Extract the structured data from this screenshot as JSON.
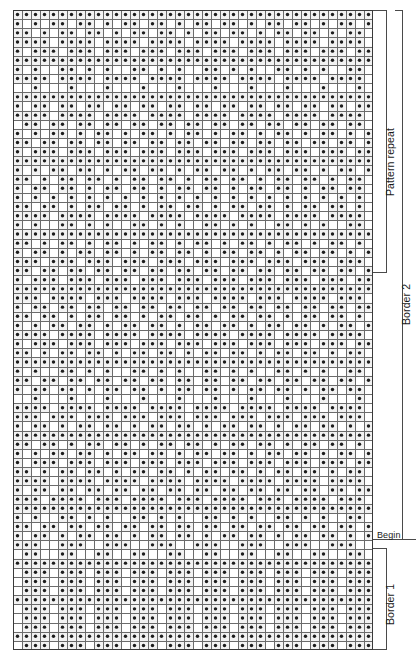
{
  "chart": {
    "grid": {
      "columns": 40,
      "rows": 70,
      "cell_size_px": 9,
      "filled_symbol": "dot",
      "empty_symbol": "blank",
      "grid_line_color": "#6b6b6b",
      "dot_color": "#1c1c1c",
      "cell_background": "#f2f2f2",
      "empty_cell_background": "#ffffff"
    },
    "rows_data": [
      "1111111111111111111111111111111111111111",
      "1010110110101101101011011010110110101101",
      "1101011011010110110101101101011011010110",
      "1111011110111101111011110111101111011110",
      "1011101110111011101110111011101110111011",
      "1111111111111111111111111111111111111111",
      "1010011010100110101001101010011010100110",
      "1111011110111101111011110111101111011110",
      "0010001000100010001000100010001000100010",
      "1111111111111111111111111111111111111111",
      "1011011011011011011011011011011011011011",
      "1111011110111101111011110111101111011110",
      "0110110110110110110110110110110110110110",
      "1010110101101011010110101101011010110101",
      "1101101101101101101101101101101101101101",
      "1011101110111011101110111011101110111011",
      "1111111111111111111111111111111111111111",
      "1010110110101101101011011010110110101101",
      "1101011011010110110101101101011011010110",
      "1011011010110110101101101011011010110110",
      "1010101010101010101010101010101010101010",
      "1101101011011010110110101101101011011010",
      "1111011110111101111011110111101111011110",
      "1010011010100110101001101010011010100110",
      "1111111111111111111111111111111111111111",
      "1101011010110101101011010110101101011010",
      "1011010110110101101101011011010110110101",
      "1110111011101110111011101110111011101110",
      "1101101101101101101101101101101101101101",
      "1011101110111011101110111011101110111011",
      "1111111111111111111111111111111111111111",
      "1110111101110111101110111101110111101110",
      "1011011011011011011011011011011011011011",
      "1101101011011010110110101101101011011010",
      "1010110110101101101011011010110110101101",
      "1111011110111101111011110111101111011110",
      "1011101110111011101110111011101110111011",
      "1101011011010110110101101101011011010110",
      "1111111111111111111111111111111111111111",
      "1010011010100110101001101010011010100110",
      "1101101101101101101101101101101101101101",
      "1011011010110110101101101011011010110110",
      "0010001000100010001000100010001000100010",
      "1111011110111101111011110111101111011110",
      "1110111011101110111011101110111011101110",
      "1011010110110101101101011011010110110101",
      "1111111111111111111111111111111111111111",
      "1101101011011010110110101101101011011010",
      "1010110110101101101011011010110110101101",
      "1011101110111011101110111011101110111011",
      "1101011011010110110101101101011011010110",
      "1111011110111101111011110111101111011110",
      "1011011011011011011011011011011011011011",
      "1110111101110111101110111101110111101110",
      "1111111111111111111111111111111111111111",
      "1010011010100110101001101010011010100110",
      "1101101101101101101101101101101101101101",
      "1011010110110101101101011011010110110101",
      "1110011100111001110011100111001110011100",
      "0110011001100110011001100110011001100110",
      "1111111111111111111111111111111111111111",
      "0111011101110111011101110111011101110111",
      "0111011101110111011101110111011101110111",
      "0111011101110111011101110111011101110111",
      "1111111111111111111111111111111111111111",
      "0111011101110111011101110111011101110111",
      "0111011101110111011101110111011101110111",
      "0111011101110111011101110111011101110111",
      "1111111111111111111111111111111111111111",
      "0111011101110111011101110111011101110111"
    ]
  },
  "annotations": {
    "pattern_repeat_label": "Pattern repeat",
    "border2_label": "Border 2",
    "begin_label": "Begin",
    "border1_label": "Border 1"
  }
}
